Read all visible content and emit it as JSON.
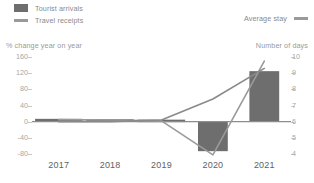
{
  "legend": {
    "left_items": [
      {
        "label": "Tourist arrivals",
        "marker": "bar-swatch-icon",
        "color": "#6e6e6e"
      },
      {
        "label": "Travel receipts",
        "marker": "line-swatch-icon",
        "color": "#9a9a9a"
      }
    ],
    "right_items": [
      {
        "label": "Average stay",
        "marker": "line-swatch-icon",
        "color": "#8a8a8a"
      }
    ]
  },
  "axes": {
    "left_title": "% change year on year",
    "right_title": "Number of days"
  },
  "chart_data": {
    "type": "bar",
    "title": "",
    "subtitle": "",
    "xlabel": "",
    "ylabel": "% change year on year",
    "y2label": "Number of days",
    "categories": [
      "2017",
      "2018",
      "2019",
      "2020",
      "2021"
    ],
    "ylim": [
      -80,
      160
    ],
    "yticks": [
      160,
      120,
      80,
      40,
      0,
      -40,
      -80
    ],
    "y2lim": [
      4,
      10
    ],
    "y2ticks": [
      10,
      9,
      8,
      7,
      6,
      5,
      4
    ],
    "grid": false,
    "legend_position": "top",
    "series": [
      {
        "name": "Tourist arrivals",
        "type": "bar",
        "axis": "left",
        "color": "#6e6e6e",
        "values": [
          7,
          6,
          5,
          -73,
          125
        ]
      },
      {
        "name": "Travel receipts",
        "type": "line",
        "axis": "left",
        "color": "#9a9a9a",
        "values": [
          5,
          4,
          2,
          -82,
          150
        ]
      },
      {
        "name": "Average stay",
        "type": "line",
        "axis": "right",
        "color": "#8a8a8a",
        "values": [
          6.0,
          6.0,
          6.1,
          7.4,
          9.3
        ]
      }
    ]
  }
}
